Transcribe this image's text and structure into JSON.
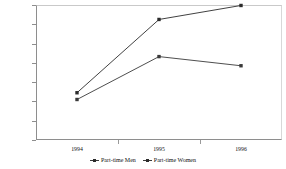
{
  "chart_data": {
    "type": "line",
    "title": "",
    "subtitle": "",
    "xlabel": "",
    "ylabel": "",
    "categories": [
      "1994",
      "1995",
      "1996"
    ],
    "x": [
      1994,
      1995,
      1996
    ],
    "series": [
      {
        "name": "Part-time Men",
        "values": [
          242000,
          286500,
          277000
        ],
        "marker": "square",
        "color": "#3a3a3a"
      },
      {
        "name": "Part-time Women",
        "values": [
          249000,
          325000,
          339500
        ],
        "marker": "square",
        "color": "#2b2b2b"
      }
    ],
    "ylim": [
      200000,
      340000
    ],
    "ytick_values": [
      200000,
      220000,
      240000,
      260000,
      280000,
      300000,
      320000,
      340000
    ],
    "ytick_labels": [
      "200000",
      "220000",
      "240000",
      "260000",
      "280000",
      "300000",
      "320000",
      "340000"
    ],
    "xtick_labels": [
      "1994",
      "1995",
      "1996"
    ],
    "grid": false,
    "legend_position": "bottom"
  },
  "legend": {
    "entries": [
      {
        "label": "Part-time Men"
      },
      {
        "label": "Part-time Women"
      }
    ]
  }
}
